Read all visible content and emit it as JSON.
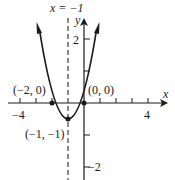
{
  "graph": {
    "equation_hint": "y = (x+1)^2 - 1",
    "axis_of_symmetry_label": "x = −1",
    "x_axis_label": "x",
    "y_axis_label": "y",
    "tick_labels": {
      "x_neg4": "−4",
      "x_4": "4",
      "y_2": "2",
      "y_neg2": "−2"
    },
    "points": [
      {
        "label": "(−2, 0)",
        "x": -2,
        "y": 0
      },
      {
        "label": "(0, 0)",
        "x": 0,
        "y": 0
      },
      {
        "label": "(−1, −1)",
        "x": -1,
        "y": -1
      }
    ],
    "colors": {
      "ink": "#1a1a1a",
      "background": "#ffffff"
    }
  }
}
